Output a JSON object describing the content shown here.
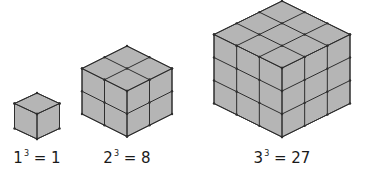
{
  "figure": {
    "fill_color": "#b5b5b5",
    "line_color": "#2e2e2e",
    "cubes": [
      {
        "n": 1,
        "base": "1",
        "exponent": "3",
        "result": "1",
        "top": [
          37,
          93
        ],
        "size": 23,
        "half_w": 22.5,
        "half_h": 10.5,
        "label_x": 37
      },
      {
        "n": 2,
        "base": "2",
        "exponent": "3",
        "result": "8",
        "top": [
          127,
          46
        ],
        "size": 46,
        "half_w": 45,
        "half_h": 22.5,
        "label_x": 127
      },
      {
        "n": 3,
        "base": "3",
        "exponent": "3",
        "result": "27",
        "top": [
          282,
          1
        ],
        "size": 69,
        "half_w": 68,
        "half_h": 33.5,
        "label_x": 282
      }
    ],
    "label_y": 150
  }
}
